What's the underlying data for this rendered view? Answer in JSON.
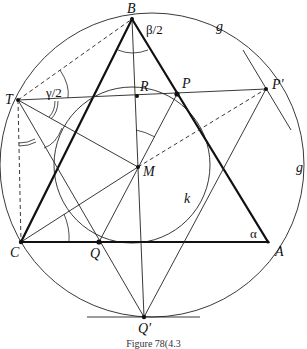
{
  "figure": {
    "caption": "Figure 78(4.3",
    "points": {
      "B": {
        "label": "B",
        "x": 132,
        "y": 19
      },
      "C": {
        "label": "C",
        "x": 21,
        "y": 242
      },
      "A": {
        "label": "A",
        "x": 268,
        "y": 242
      },
      "T": {
        "label": "T",
        "x": 18,
        "y": 100
      },
      "R": {
        "label": "R",
        "x": 137,
        "y": 96
      },
      "P": {
        "label": "P",
        "x": 177,
        "y": 94
      },
      "P_prime": {
        "label": "P'",
        "x": 266,
        "y": 89
      },
      "M": {
        "label": "M",
        "x": 138,
        "y": 167
      },
      "Q": {
        "label": "Q",
        "x": 99,
        "y": 242
      },
      "Q_prime": {
        "label": "Q'",
        "x": 144,
        "y": 317
      }
    },
    "circle_labels": {
      "g_top": "g",
      "g_right": "g",
      "k": "k"
    },
    "angle_labels": {
      "beta_half": "β/2",
      "gamma_half": "γ/2",
      "alpha": "α"
    }
  }
}
